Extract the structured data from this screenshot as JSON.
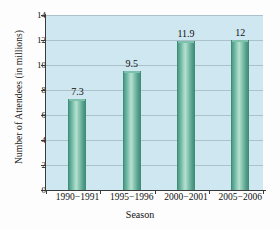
{
  "chart_data": {
    "type": "bar",
    "title": "",
    "categories": [
      "1990−1991",
      "1995−1996",
      "2000−2001",
      "2005−2006"
    ],
    "values": [
      7.3,
      9.5,
      11.9,
      12
    ],
    "value_labels": [
      "7.3",
      "9.5",
      "11.9",
      "12"
    ],
    "xlabel": "Season",
    "ylabel": "Number of Attendees (in millions)",
    "ylim": [
      0,
      14
    ],
    "yticks": [
      0,
      2,
      4,
      6,
      8,
      10,
      12,
      14
    ],
    "ytick_labels": [
      "0",
      "2",
      "4",
      "6",
      "8",
      "10",
      "12",
      "14"
    ],
    "grid": true,
    "grid_axis": "y",
    "legend": false,
    "bar_color": "#6fb9a3",
    "plot_background": "#cfe7f1",
    "gridline_color": "#9fb6bd"
  }
}
